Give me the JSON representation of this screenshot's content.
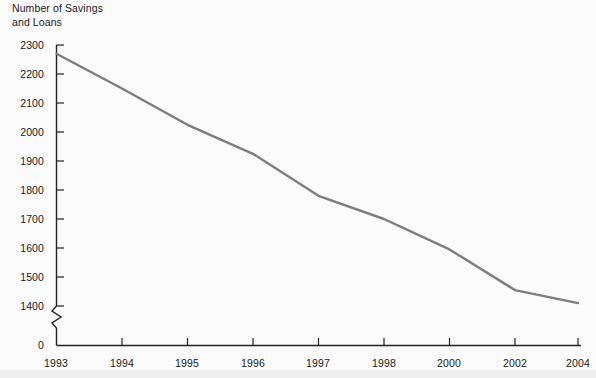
{
  "chart_data": {
    "type": "line",
    "title": "Number of Savings\nand Loans",
    "xlabel": "",
    "ylabel": "Number of Savings and Loans",
    "x": [
      "1993",
      "1994",
      "1995",
      "1996",
      "1997",
      "1998",
      "2000",
      "2002",
      "2004"
    ],
    "categories": [
      "1993",
      "1994",
      "1995",
      "1996",
      "1997",
      "1998",
      "2000",
      "2002",
      "2004"
    ],
    "values": [
      2270,
      2150,
      2025,
      1925,
      1780,
      1700,
      1595,
      1455,
      1410
    ],
    "series": [
      {
        "name": "Number of Savings and Loans",
        "values": [
          2270,
          2150,
          2025,
          1925,
          1780,
          1700,
          1595,
          1455,
          1410
        ]
      }
    ],
    "ytick_labels": [
      "0",
      "1400",
      "1500",
      "1600",
      "1700",
      "1800",
      "1900",
      "2000",
      "2100",
      "2200",
      "2300"
    ],
    "ylim": [
      1400,
      2300
    ],
    "yaxis_break": true,
    "yaxis_break_note": "zigzag break between 0 and 1400",
    "grid": false,
    "legend": "none",
    "line_color": "#7d7d7d",
    "axis_color": "#222222",
    "background_color": "#fbfbfb",
    "xtick_labels": [
      "1993",
      "1994",
      "1995",
      "1996",
      "1997",
      "1998",
      "2000",
      "2002",
      "2004"
    ]
  },
  "ytick_text": {
    "t0": "0",
    "t1400": "1400",
    "t1500": "1500",
    "t1600": "1600",
    "t1700": "1700",
    "t1800": "1800",
    "t1900": "1900",
    "t2000": "2000",
    "t2100": "2100",
    "t2200": "2200",
    "t2300": "2300"
  },
  "xtick_text": {
    "x0": "1993",
    "x1": "1994",
    "x2": "1995",
    "x3": "1996",
    "x4": "1997",
    "x5": "1998",
    "x6": "2000",
    "x7": "2002",
    "x8": "2004"
  }
}
